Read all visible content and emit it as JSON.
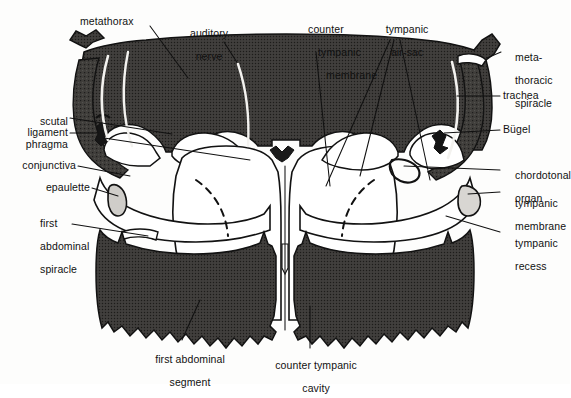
{
  "figure": {
    "colors": {
      "background": "#fdfdfc",
      "cuticle_dark": "#3c3a38",
      "cavity_light": "#ffffff",
      "outline": "#121212",
      "leader_line": "#111111",
      "leader_line_on_dark": "#f2f2f0",
      "label_text": "#111111"
    }
  },
  "labels": {
    "metathorax": "metathorax",
    "auditory_nerve_1": "auditory",
    "auditory_nerve_2": "nerve",
    "counter_tympanic_membrane_1": "counter",
    "counter_tympanic_membrane_2": "tympanic",
    "counter_tympanic_membrane_3": "membrane",
    "tympanic_air_sac_1": "tympanic",
    "tympanic_air_sac_2": "air-sac",
    "metathoracic_spiracle_1": "meta-",
    "metathoracic_spiracle_2": "thoracic",
    "metathoracic_spiracle_3": "spiracle",
    "trachea": "trachea",
    "bugel": "Bügel",
    "chordotonal_organ_1": "chordotonal",
    "chordotonal_organ_2": "organ",
    "tympanic_membrane_1": "tympanic",
    "tympanic_membrane_2": "membrane",
    "tympanic_recess_1": "tympanic",
    "tympanic_recess_2": "recess",
    "scutal_phragma_1": "scutal",
    "scutal_phragma_2": "phragma",
    "ligament": "ligament",
    "conjunctiva": "conjunctiva",
    "epaulette": "epaulette",
    "first_abdominal_spiracle_1": "first",
    "first_abdominal_spiracle_2": "abdominal",
    "first_abdominal_spiracle_3": "spiracle",
    "first_abdominal_segment_1": "first abdominal",
    "first_abdominal_segment_2": "segment",
    "counter_tympanic_cavity_1": "counter tympanic",
    "counter_tympanic_cavity_2": "cavity"
  },
  "structures": [
    {
      "name": "metathorax",
      "side": "both",
      "kind": "cuticle"
    },
    {
      "name": "auditory-nerve",
      "side": "left",
      "kind": "nerve"
    },
    {
      "name": "counter-tympanic-membrane",
      "side": "right",
      "kind": "membrane"
    },
    {
      "name": "tympanic-air-sac",
      "side": "right",
      "kind": "air-sac"
    },
    {
      "name": "metathoracic-spiracle",
      "side": "right",
      "kind": "spiracle"
    },
    {
      "name": "trachea",
      "side": "right",
      "kind": "trachea"
    },
    {
      "name": "bugel",
      "side": "right",
      "kind": "sclerite"
    },
    {
      "name": "chordotonal-organ",
      "side": "right",
      "kind": "organ"
    },
    {
      "name": "tympanic-membrane",
      "side": "right",
      "kind": "membrane"
    },
    {
      "name": "tympanic-recess",
      "side": "right",
      "kind": "recess"
    },
    {
      "name": "scutal-phragma",
      "side": "left",
      "kind": "sclerite"
    },
    {
      "name": "ligament",
      "side": "left",
      "kind": "ligament"
    },
    {
      "name": "conjunctiva",
      "side": "left",
      "kind": "membrane"
    },
    {
      "name": "epaulette",
      "side": "left",
      "kind": "sclerite"
    },
    {
      "name": "first-abdominal-spiracle",
      "side": "left",
      "kind": "spiracle"
    },
    {
      "name": "first-abdominal-segment",
      "side": "both",
      "kind": "cuticle"
    },
    {
      "name": "counter-tympanic-cavity",
      "side": "center",
      "kind": "cavity"
    }
  ]
}
